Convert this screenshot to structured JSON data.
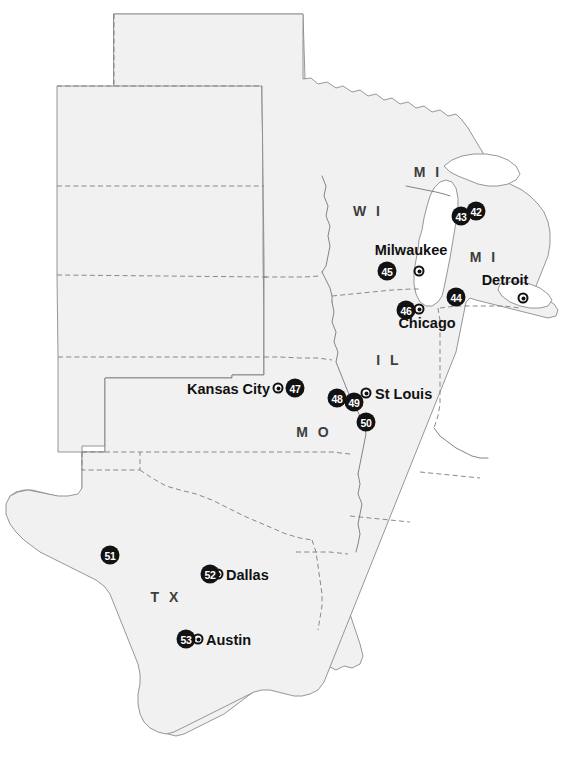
{
  "map": {
    "title": "United States — Midwest, Great Lakes and South regional map",
    "width": 566,
    "height": 784,
    "colors": {
      "background": "#ffffff",
      "land_fill": "#f1f1f1",
      "border_stroke": "#7d7d7d",
      "coast_stroke": "#8b8b8b",
      "marker_fill": "#121212",
      "marker_text": "#ffffff",
      "label_text": "#1a1a1a",
      "state_label_text": "#3d3d3d"
    }
  },
  "state_labels": [
    {
      "id": "mi-upper",
      "text": "M I",
      "x": 428,
      "y": 172
    },
    {
      "id": "wi",
      "text": "W I",
      "x": 368,
      "y": 211
    },
    {
      "id": "mi-lower",
      "text": "M I",
      "x": 484,
      "y": 257
    },
    {
      "id": "il",
      "text": "I L",
      "x": 389,
      "y": 360
    },
    {
      "id": "mo",
      "text": "M O",
      "x": 314,
      "y": 432
    },
    {
      "id": "tx",
      "text": "T X",
      "x": 166,
      "y": 597
    }
  ],
  "cities": [
    {
      "id": "milwaukee",
      "name": "Milwaukee",
      "label_x": 411,
      "label_y": 257,
      "anchor": "above",
      "dot_x": 419,
      "dot_y": 271
    },
    {
      "id": "detroit",
      "name": "Detroit",
      "label_x": 505,
      "label_y": 287,
      "anchor": "above",
      "dot_x": 523,
      "dot_y": 298
    },
    {
      "id": "chicago",
      "name": "Chicago",
      "label_x": 427,
      "label_y": 320,
      "anchor": "above",
      "dot_x": 419,
      "dot_y": 309
    },
    {
      "id": "kansas-city",
      "name": "Kansas City",
      "label_x": 270,
      "label_y": 389,
      "anchor": "left",
      "dot_x": 278,
      "dot_y": 388
    },
    {
      "id": "st-louis",
      "name": "St Louis",
      "label_x": 375,
      "label_y": 394,
      "anchor": "right",
      "dot_x": 366,
      "dot_y": 393
    },
    {
      "id": "dallas",
      "name": "Dallas",
      "label_x": 226,
      "label_y": 575,
      "anchor": "right",
      "dot_x": 218,
      "dot_y": 574
    },
    {
      "id": "austin",
      "name": "Austin",
      "label_x": 206,
      "label_y": 640,
      "anchor": "right",
      "dot_x": 198,
      "dot_y": 639
    }
  ],
  "site_markers": [
    {
      "id": "site-42",
      "number": "42",
      "x": 476,
      "y": 211
    },
    {
      "id": "site-43",
      "number": "43",
      "x": 461,
      "y": 216
    },
    {
      "id": "site-44",
      "number": "44",
      "x": 456,
      "y": 297
    },
    {
      "id": "site-45",
      "number": "45",
      "x": 387,
      "y": 271
    },
    {
      "id": "site-46",
      "number": "46",
      "x": 406,
      "y": 310
    },
    {
      "id": "site-47",
      "number": "47",
      "x": 295,
      "y": 388
    },
    {
      "id": "site-48",
      "number": "48",
      "x": 337,
      "y": 398
    },
    {
      "id": "site-49",
      "number": "49",
      "x": 354,
      "y": 402
    },
    {
      "id": "site-50",
      "number": "50",
      "x": 366,
      "y": 422
    },
    {
      "id": "site-51",
      "number": "51",
      "x": 110,
      "y": 555
    },
    {
      "id": "site-52",
      "number": "52",
      "x": 210,
      "y": 574
    },
    {
      "id": "site-53",
      "number": "53",
      "x": 186,
      "y": 639
    }
  ]
}
